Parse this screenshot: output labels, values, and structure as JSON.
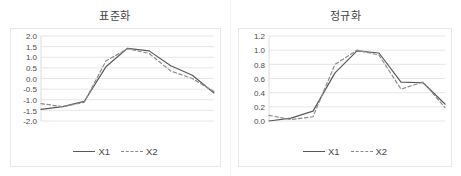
{
  "figure": {
    "width": 461,
    "height": 176,
    "background": "#ffffff",
    "line_color_x1": "#595959",
    "line_color_x2": "#8c8c8c",
    "grid_color": "#e6e6e6",
    "frame_color": "#e8e8e8",
    "text_color": "#4a4a4a"
  },
  "panels": [
    {
      "id": "standardization",
      "title": "표준화",
      "legend": [
        {
          "label": "X1",
          "style": "solid",
          "color": "#595959"
        },
        {
          "label": "X2",
          "style": "dashed",
          "color": "#8c8c8c"
        }
      ]
    },
    {
      "id": "normalization",
      "title": "정규화",
      "legend": [
        {
          "label": "X1",
          "style": "solid",
          "color": "#595959"
        },
        {
          "label": "X2",
          "style": "dashed",
          "color": "#8c8c8c"
        }
      ]
    }
  ],
  "chart_data": [
    {
      "type": "line",
      "title": "표준화",
      "xlabel": "",
      "ylabel": "",
      "x": [
        1,
        2,
        3,
        4,
        5,
        6,
        7,
        8,
        9
      ],
      "categories": [
        "1",
        "2",
        "3",
        "4",
        "5",
        "6",
        "7",
        "8",
        "9"
      ],
      "series": [
        {
          "name": "X1",
          "style": "solid",
          "color": "#595959",
          "values": [
            -1.45,
            -1.32,
            -1.08,
            0.55,
            1.42,
            1.3,
            0.6,
            0.15,
            -0.68
          ]
        },
        {
          "name": "X2",
          "style": "dashed",
          "color": "#8c8c8c",
          "values": [
            -1.18,
            -1.33,
            -1.12,
            0.82,
            1.4,
            1.18,
            0.35,
            0.0,
            -0.62
          ]
        }
      ],
      "ylim": [
        -2.0,
        2.0
      ],
      "yticks": [
        2.0,
        1.5,
        1.0,
        0.5,
        0.0,
        -0.5,
        -1.0,
        -1.5,
        -2.0
      ],
      "ytick_labels": [
        "2.0",
        "1.5",
        "1.0",
        "0.5",
        "0.0",
        "-0.5",
        "-1.0",
        "-1.5",
        "-2.0"
      ],
      "grid": true,
      "legend_position": "bottom"
    },
    {
      "type": "line",
      "title": "정규화",
      "xlabel": "",
      "ylabel": "",
      "x": [
        1,
        2,
        3,
        4,
        5,
        6,
        7,
        8,
        9
      ],
      "categories": [
        "1",
        "2",
        "3",
        "4",
        "5",
        "6",
        "7",
        "8",
        "9"
      ],
      "series": [
        {
          "name": "X1",
          "style": "solid",
          "color": "#595959",
          "values": [
            0.0,
            0.04,
            0.14,
            0.68,
            0.99,
            0.96,
            0.55,
            0.54,
            0.24
          ]
        },
        {
          "name": "X2",
          "style": "dashed",
          "color": "#8c8c8c",
          "values": [
            0.08,
            0.02,
            0.06,
            0.8,
            1.0,
            0.93,
            0.45,
            0.55,
            0.19
          ]
        }
      ],
      "ylim": [
        0.0,
        1.2
      ],
      "yticks": [
        1.2,
        1.0,
        0.8,
        0.6,
        0.4,
        0.2,
        0.0
      ],
      "ytick_labels": [
        "1.2",
        "1.0",
        "0.8",
        "0.6",
        "0.4",
        "0.2",
        "0.0"
      ],
      "grid": true,
      "legend_position": "bottom"
    }
  ]
}
